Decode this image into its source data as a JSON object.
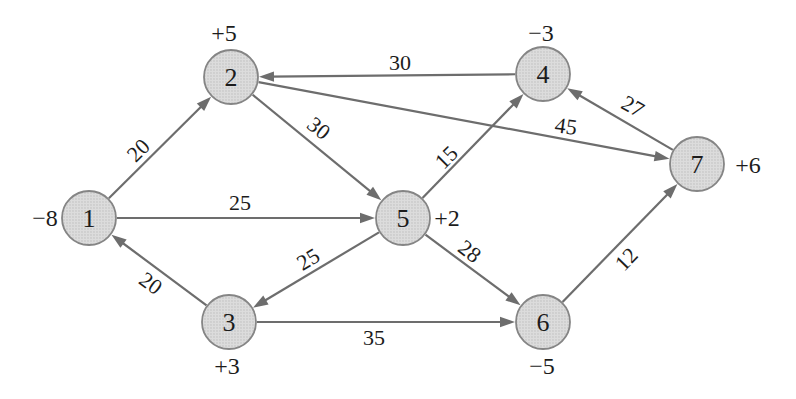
{
  "diagram": {
    "type": "directed-flow-network",
    "background": "#ffffff",
    "edge_color": "#6d6d6d",
    "node_stroke": "#858585",
    "node_fill_base": "#dcdcdc",
    "node_fill_dot": "#b9b9b9",
    "text_color": "#1c1c1c",
    "node_radius": 27,
    "nodes": [
      {
        "id": "1",
        "x": 89,
        "y": 218,
        "supply": "−8",
        "supply_dx": -44,
        "supply_dy": 0
      },
      {
        "id": "2",
        "x": 231,
        "y": 77,
        "supply": "+5",
        "supply_dx": -7,
        "supply_dy": -44
      },
      {
        "id": "3",
        "x": 229,
        "y": 322,
        "supply": "+3",
        "supply_dx": -2,
        "supply_dy": 44
      },
      {
        "id": "4",
        "x": 543,
        "y": 74,
        "supply": "−3",
        "supply_dx": -2,
        "supply_dy": -41
      },
      {
        "id": "5",
        "x": 403,
        "y": 218,
        "supply": "+2",
        "supply_dx": 44,
        "supply_dy": 0
      },
      {
        "id": "6",
        "x": 543,
        "y": 322,
        "supply": "−5",
        "supply_dx": -1,
        "supply_dy": 44
      },
      {
        "id": "7",
        "x": 697,
        "y": 164,
        "supply": "+6",
        "supply_dx": 51,
        "supply_dy": 1
      }
    ],
    "edges": [
      {
        "from": "1",
        "to": "2",
        "weight": "20",
        "lx": 138,
        "ly": 150,
        "rot": -45
      },
      {
        "from": "1",
        "to": "5",
        "weight": "25",
        "lx": 240,
        "ly": 202,
        "rot": 0
      },
      {
        "from": "3",
        "to": "1",
        "weight": "20",
        "lx": 151,
        "ly": 283,
        "rot": 36
      },
      {
        "from": "4",
        "to": "2",
        "weight": "30",
        "lx": 400,
        "ly": 62,
        "rot": 0
      },
      {
        "from": "2",
        "to": "5",
        "weight": "30",
        "lx": 319,
        "ly": 128,
        "rot": 39
      },
      {
        "from": "2",
        "to": "7",
        "weight": "45",
        "lx": 566,
        "ly": 126,
        "rot": 8
      },
      {
        "from": "5",
        "to": "4",
        "weight": "15",
        "lx": 446,
        "ly": 157,
        "rot": -45
      },
      {
        "from": "7",
        "to": "4",
        "weight": "27",
        "lx": 633,
        "ly": 106,
        "rot": 29
      },
      {
        "from": "5",
        "to": "3",
        "weight": "25",
        "lx": 308,
        "ly": 259,
        "rot": -31
      },
      {
        "from": "5",
        "to": "6",
        "weight": "28",
        "lx": 470,
        "ly": 251,
        "rot": 37
      },
      {
        "from": "3",
        "to": "6",
        "weight": "35",
        "lx": 374,
        "ly": 337,
        "rot": 0
      },
      {
        "from": "6",
        "to": "7",
        "weight": "12",
        "lx": 626,
        "ly": 259,
        "rot": -46
      }
    ]
  }
}
